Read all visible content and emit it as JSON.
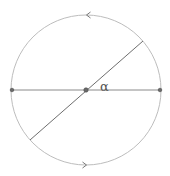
{
  "diagram": {
    "type": "geometry",
    "colors": {
      "circle": "#bdbdbd",
      "horizontal_line": "#8a8a8a",
      "diagonal_line": "#6e6e6e",
      "points": "#6a6a6a",
      "arrows": "#7a7a7a",
      "label": "#555555"
    },
    "circle": {
      "cx": 86,
      "cy": 90,
      "r": 75
    },
    "horizontal_diameter": {
      "x1": 12,
      "y1": 90,
      "x2": 160,
      "y2": 90
    },
    "diagonal_diameter": {
      "x1": 143,
      "y1": 41,
      "x2": 30,
      "y2": 140
    },
    "points": [
      {
        "name": "left-endpoint",
        "x": 12,
        "y": 90
      },
      {
        "name": "center",
        "x": 86,
        "y": 90
      },
      {
        "name": "right-endpoint",
        "x": 160,
        "y": 90
      }
    ],
    "arrows": [
      {
        "name": "top-arrow",
        "x": 88,
        "y": 15,
        "direction": "left"
      },
      {
        "name": "bottom-arrow",
        "x": 85,
        "y": 165,
        "direction": "right"
      }
    ],
    "labels": {
      "angle": "α"
    },
    "angle_label_pos": {
      "x": 100,
      "y": 91
    }
  }
}
